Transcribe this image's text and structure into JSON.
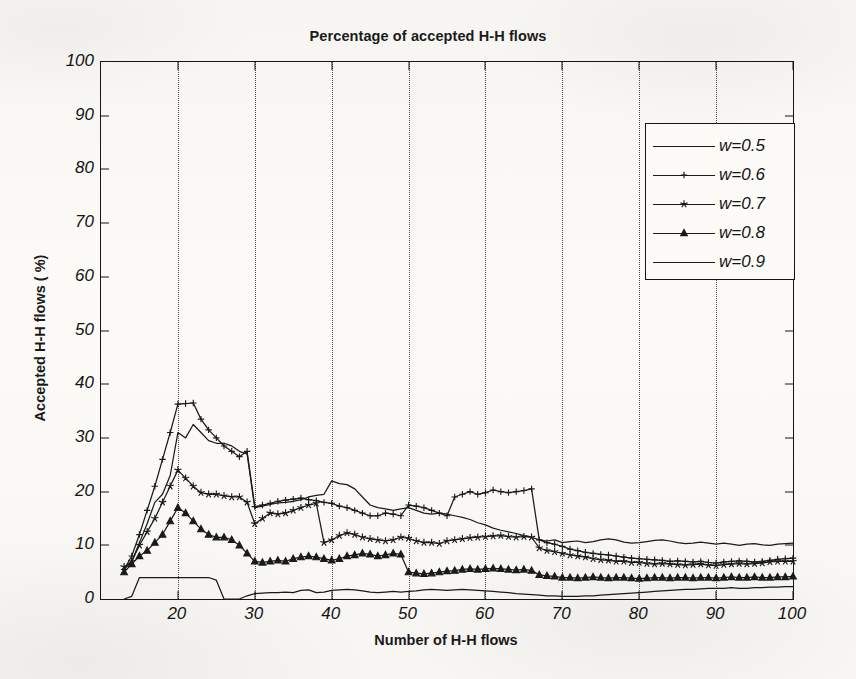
{
  "chart_data": {
    "type": "line",
    "title": "Percentage of accepted H-H flows",
    "xlabel": "Number of H-H flows",
    "ylabel": "Accepted H-H flows ( %)",
    "xlim": [
      10,
      100
    ],
    "ylim": [
      0,
      100
    ],
    "xticks": [
      20,
      30,
      40,
      50,
      60,
      70,
      80,
      90,
      100
    ],
    "yticks": [
      0,
      10,
      20,
      30,
      40,
      50,
      60,
      70,
      80,
      90,
      100
    ],
    "grid": "vertical-dotted",
    "legend_position": "upper-right",
    "series": [
      {
        "name": "w=0.5",
        "marker": "none",
        "color": "#1a1a1a",
        "x": [
          13,
          14,
          15,
          16,
          17,
          18,
          19,
          20,
          21,
          22,
          23,
          24,
          25,
          26,
          27,
          28,
          29,
          30,
          31,
          32,
          33,
          34,
          35,
          36,
          37,
          38,
          39,
          40,
          41,
          42,
          43,
          44,
          45,
          46,
          47,
          48,
          49,
          50,
          51,
          52,
          53,
          54,
          55,
          56,
          57,
          58,
          59,
          60,
          61,
          62,
          63,
          64,
          65,
          66,
          67,
          68,
          69,
          70,
          71,
          72,
          73,
          74,
          75,
          76,
          77,
          78,
          79,
          80,
          81,
          82,
          83,
          84,
          85,
          86,
          87,
          88,
          89,
          90,
          91,
          92,
          93,
          94,
          95,
          96,
          97,
          98,
          99,
          100
        ],
        "y": [
          5.5,
          7.0,
          10.5,
          14.0,
          18.0,
          19.5,
          23.0,
          31.0,
          30.0,
          32.5,
          31.0,
          29.5,
          29.0,
          29.0,
          28.5,
          27.5,
          27.0,
          17.0,
          17.3,
          17.6,
          17.9,
          18.0,
          18.2,
          18.5,
          19.0,
          19.3,
          19.5,
          22.0,
          21.5,
          21.3,
          20.5,
          19.0,
          17.5,
          17.0,
          16.8,
          16.5,
          16.8,
          17.0,
          16.5,
          16.0,
          15.8,
          16.0,
          15.8,
          15.5,
          15.2,
          14.8,
          14.2,
          13.8,
          13.2,
          12.8,
          12.5,
          12.2,
          11.8,
          11.5,
          11.0,
          10.8,
          11.0,
          10.5,
          10.7,
          10.8,
          10.5,
          10.7,
          11.0,
          11.2,
          11.0,
          10.6,
          10.4,
          10.5,
          10.7,
          10.9,
          11.0,
          10.8,
          10.5,
          10.3,
          10.4,
          10.6,
          10.4,
          10.2,
          10.4,
          10.2,
          10.0,
          10.2,
          10.3,
          10.1,
          10.0,
          10.2,
          10.3,
          10.4
        ]
      },
      {
        "name": "w=0.6",
        "marker": "plus",
        "color": "#1a1a1a",
        "x": [
          13,
          14,
          15,
          16,
          17,
          18,
          19,
          20,
          21,
          22,
          23,
          24,
          25,
          26,
          27,
          28,
          29,
          30,
          31,
          32,
          33,
          34,
          35,
          36,
          37,
          38,
          39,
          40,
          41,
          42,
          43,
          44,
          45,
          46,
          47,
          48,
          49,
          50,
          51,
          52,
          53,
          54,
          55,
          56,
          57,
          58,
          59,
          60,
          61,
          62,
          63,
          64,
          65,
          66,
          67,
          68,
          69,
          70,
          71,
          72,
          73,
          74,
          75,
          76,
          77,
          78,
          79,
          80,
          81,
          82,
          83,
          84,
          85,
          86,
          87,
          88,
          89,
          90,
          91,
          92,
          93,
          94,
          95,
          96,
          97,
          98,
          99,
          100
        ],
        "y": [
          5.5,
          8.0,
          12.0,
          16.5,
          21.0,
          26.0,
          31.0,
          36.3,
          36.4,
          36.5,
          33.5,
          31.5,
          30.0,
          28.5,
          27.5,
          26.5,
          27.5,
          17.2,
          17.5,
          17.8,
          18.2,
          18.4,
          18.6,
          18.8,
          18.5,
          18.3,
          18.0,
          17.8,
          17.3,
          17.0,
          16.5,
          16.0,
          15.5,
          15.5,
          16.0,
          15.8,
          15.5,
          17.5,
          17.3,
          17.0,
          16.5,
          16.0,
          15.5,
          19.0,
          19.5,
          20.0,
          19.5,
          19.8,
          20.3,
          20.0,
          19.8,
          20.0,
          20.2,
          20.5,
          11.0,
          10.5,
          10.2,
          9.8,
          9.3,
          9.0,
          8.7,
          8.5,
          8.3,
          8.2,
          8.0,
          7.8,
          7.6,
          7.5,
          7.4,
          7.3,
          7.2,
          7.0,
          7.1,
          7.0,
          6.9,
          7.0,
          6.8,
          6.7,
          6.9,
          7.0,
          7.1,
          7.0,
          6.9,
          7.0,
          7.2,
          7.4,
          7.5,
          7.6
        ]
      },
      {
        "name": "w=0.7",
        "marker": "star",
        "color": "#1a1a1a",
        "x": [
          13,
          14,
          15,
          16,
          17,
          18,
          19,
          20,
          21,
          22,
          23,
          24,
          25,
          26,
          27,
          28,
          29,
          30,
          31,
          32,
          33,
          34,
          35,
          36,
          37,
          38,
          39,
          40,
          41,
          42,
          43,
          44,
          45,
          46,
          47,
          48,
          49,
          50,
          51,
          52,
          53,
          54,
          55,
          56,
          57,
          58,
          59,
          60,
          61,
          62,
          63,
          64,
          65,
          66,
          67,
          68,
          69,
          70,
          71,
          72,
          73,
          74,
          75,
          76,
          77,
          78,
          79,
          80,
          81,
          82,
          83,
          84,
          85,
          86,
          87,
          88,
          89,
          90,
          91,
          92,
          93,
          94,
          95,
          96,
          97,
          98,
          99,
          100
        ],
        "y": [
          6.0,
          7.0,
          10.0,
          12.5,
          15.0,
          18.0,
          21.0,
          24.0,
          22.5,
          21.0,
          19.8,
          19.5,
          19.5,
          19.2,
          19.0,
          19.0,
          18.0,
          14.0,
          15.0,
          16.0,
          15.8,
          16.0,
          16.5,
          17.0,
          17.5,
          17.8,
          10.5,
          11.0,
          11.8,
          12.3,
          12.0,
          11.5,
          11.2,
          11.0,
          10.8,
          11.0,
          11.5,
          11.3,
          10.8,
          10.5,
          10.5,
          10.3,
          10.8,
          11.0,
          11.2,
          11.4,
          11.5,
          11.6,
          11.7,
          11.8,
          11.6,
          11.5,
          11.6,
          11.5,
          9.5,
          9.0,
          8.8,
          8.5,
          8.2,
          8.0,
          7.8,
          7.5,
          7.3,
          7.2,
          7.0,
          7.0,
          6.8,
          6.8,
          6.6,
          6.5,
          6.6,
          6.5,
          6.4,
          6.3,
          6.4,
          6.5,
          6.3,
          6.2,
          6.4,
          6.5,
          6.6,
          6.5,
          6.6,
          6.7,
          6.9,
          7.0,
          7.0,
          7.0
        ]
      },
      {
        "name": "w=0.8",
        "marker": "triangle",
        "color": "#1a1a1a",
        "x": [
          13,
          14,
          15,
          16,
          17,
          18,
          19,
          20,
          21,
          22,
          23,
          24,
          25,
          26,
          27,
          28,
          29,
          30,
          31,
          32,
          33,
          34,
          35,
          36,
          37,
          38,
          39,
          40,
          41,
          42,
          43,
          44,
          45,
          46,
          47,
          48,
          49,
          50,
          51,
          52,
          53,
          54,
          55,
          56,
          57,
          58,
          59,
          60,
          61,
          62,
          63,
          64,
          65,
          66,
          67,
          68,
          69,
          70,
          71,
          72,
          73,
          74,
          75,
          76,
          77,
          78,
          79,
          80,
          81,
          82,
          83,
          84,
          85,
          86,
          87,
          88,
          89,
          90,
          91,
          92,
          93,
          94,
          95,
          96,
          97,
          98,
          99,
          100
        ],
        "y": [
          5.0,
          6.5,
          8.0,
          9.0,
          10.5,
          12.0,
          14.5,
          17.0,
          16.0,
          14.5,
          13.0,
          12.0,
          11.5,
          11.5,
          11.0,
          10.0,
          8.5,
          7.0,
          6.8,
          7.0,
          7.2,
          7.0,
          7.5,
          7.8,
          8.0,
          7.8,
          7.5,
          7.2,
          7.5,
          8.0,
          8.2,
          8.5,
          8.3,
          8.0,
          8.2,
          8.5,
          8.3,
          5.0,
          4.8,
          4.7,
          4.8,
          5.0,
          5.2,
          5.3,
          5.5,
          5.6,
          5.5,
          5.6,
          5.7,
          5.6,
          5.5,
          5.4,
          5.5,
          5.3,
          4.5,
          4.3,
          4.2,
          4.0,
          4.0,
          3.9,
          4.0,
          4.1,
          4.0,
          3.9,
          4.0,
          4.0,
          3.9,
          3.8,
          3.9,
          4.0,
          4.0,
          3.9,
          4.0,
          4.0,
          3.9,
          4.0,
          4.0,
          3.9,
          4.0,
          4.1,
          4.0,
          4.0,
          4.1,
          4.0,
          4.0,
          4.1,
          4.1,
          4.2
        ]
      },
      {
        "name": "w=0.9",
        "marker": "none",
        "color": "#1a1a1a",
        "x": [
          13,
          14,
          15,
          16,
          17,
          18,
          19,
          20,
          21,
          22,
          23,
          24,
          25,
          26,
          27,
          28,
          29,
          30,
          31,
          32,
          33,
          34,
          35,
          36,
          37,
          38,
          39,
          40,
          41,
          42,
          43,
          44,
          45,
          46,
          47,
          48,
          49,
          50,
          51,
          52,
          53,
          54,
          55,
          56,
          57,
          58,
          59,
          60,
          61,
          62,
          63,
          64,
          65,
          66,
          67,
          68,
          69,
          70,
          71,
          72,
          73,
          74,
          75,
          76,
          77,
          78,
          79,
          80,
          81,
          82,
          83,
          84,
          85,
          86,
          87,
          88,
          89,
          90,
          91,
          92,
          93,
          94,
          95,
          96,
          97,
          98,
          99,
          100
        ],
        "y": [
          0.0,
          0.5,
          4.0,
          4.0,
          4.0,
          4.0,
          4.0,
          4.0,
          4.0,
          4.0,
          4.0,
          4.0,
          3.5,
          0.0,
          0.0,
          0.0,
          0.6,
          1.0,
          1.1,
          1.2,
          1.2,
          1.3,
          1.2,
          1.6,
          1.7,
          1.2,
          1.3,
          1.6,
          1.7,
          1.8,
          1.7,
          1.5,
          1.3,
          1.2,
          1.3,
          1.4,
          1.3,
          1.4,
          1.5,
          1.7,
          1.8,
          1.7,
          1.6,
          1.7,
          1.8,
          1.7,
          1.6,
          1.5,
          1.4,
          1.3,
          1.2,
          1.0,
          0.9,
          0.8,
          0.7,
          0.6,
          0.6,
          0.5,
          0.5,
          0.5,
          0.6,
          0.6,
          0.7,
          0.8,
          0.9,
          1.0,
          1.1,
          1.2,
          1.3,
          1.4,
          1.5,
          1.6,
          1.7,
          1.8,
          1.8,
          1.9,
          2.0,
          2.0,
          2.0,
          2.1,
          2.0,
          2.0,
          2.1,
          2.1,
          2.2,
          2.2,
          2.3,
          2.3
        ]
      }
    ]
  },
  "axis": {
    "origin_label": "0"
  }
}
